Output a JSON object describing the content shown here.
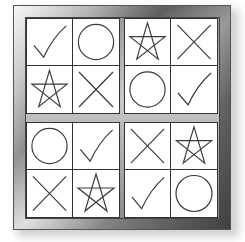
{
  "puzzle": {
    "frame_color_dark": "#5c5c5c",
    "frame_color_light": "#f4f4f4",
    "line_color": "#333333",
    "quadrants": [
      {
        "position": "top-left",
        "cells": [
          "check",
          "circle",
          "star",
          "cross"
        ]
      },
      {
        "position": "top-right",
        "cells": [
          "star",
          "cross",
          "circle",
          "check"
        ]
      },
      {
        "position": "bottom-left",
        "cells": [
          "circle",
          "check",
          "cross",
          "star"
        ]
      },
      {
        "position": "bottom-right",
        "cells": [
          "cross",
          "star",
          "check",
          "circle"
        ]
      }
    ]
  }
}
